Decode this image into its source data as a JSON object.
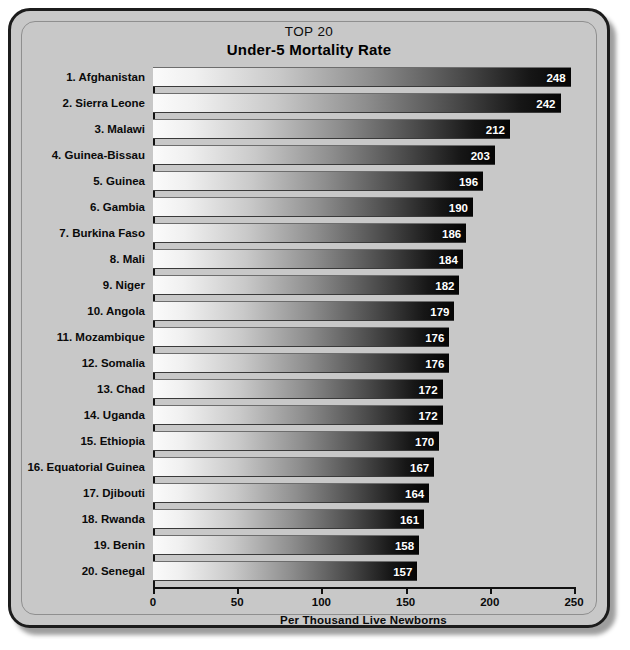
{
  "chart_data": {
    "type": "bar",
    "orientation": "horizontal",
    "title": "TOP 20",
    "subtitle": "Under-5 Mortality Rate",
    "xlabel": "Per Thousand Live Newborns",
    "ylabel": "",
    "xlim": [
      0,
      250
    ],
    "xticks": [
      0,
      50,
      100,
      150,
      200,
      250
    ],
    "xtick_labels": [
      "0",
      "50",
      "100",
      "150",
      "200",
      "250"
    ],
    "grid": false,
    "legend": false,
    "categories": [
      "1. Afghanistan",
      "2. Sierra Leone",
      "3. Malawi",
      "4. Guinea-Bissau",
      "5. Guinea",
      "6. Gambia",
      "7. Burkina Faso",
      "8. Mali",
      "9. Niger",
      "10. Angola",
      "11. Mozambique",
      "12. Somalia",
      "13. Chad",
      "14. Uganda",
      "15. Ethiopia",
      "16. Equatorial Guinea",
      "17. Djibouti",
      "18. Rwanda",
      "19. Benin",
      "20. Senegal"
    ],
    "values": [
      248,
      242,
      212,
      203,
      196,
      190,
      186,
      184,
      182,
      179,
      176,
      176,
      172,
      172,
      170,
      167,
      164,
      161,
      158,
      157
    ],
    "value_labels": [
      "248",
      "242",
      "212",
      "203",
      "196",
      "190",
      "186",
      "184",
      "182",
      "179",
      "176",
      "176",
      "172",
      "172",
      "170",
      "167",
      "164",
      "161",
      "158",
      "157"
    ],
    "colors": {
      "panel_background": "#c8c8c8",
      "page_background": "#ffffff",
      "panel_border": "#1c1c1c",
      "bar_gradient_start": "#fbfbfb",
      "bar_gradient_end": "#050505",
      "axis": "#111111",
      "text": "#0a0a0a",
      "value_label_text": "#ffffff"
    }
  }
}
